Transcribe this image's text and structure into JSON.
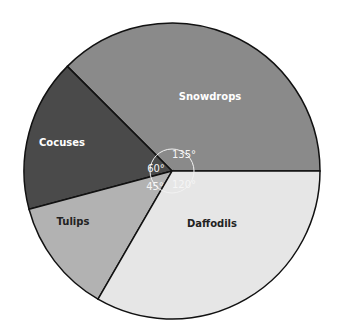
{
  "chart_data": {
    "type": "pie",
    "title": "",
    "unit": "degrees",
    "categories": [
      "Snowdrops",
      "Cocuses",
      "Tulips",
      "Daffodils"
    ],
    "values": [
      135,
      60,
      45,
      120
    ],
    "angle_labels": [
      "135°",
      "60°",
      "45°",
      "120°"
    ],
    "colors": [
      "#8a8a8a",
      "#4a4a4a",
      "#b2b2b2",
      "#e6e6e6"
    ],
    "label_colors": [
      "#ffffff",
      "#ffffff",
      "#222222",
      "#222222"
    ],
    "legend": "none"
  }
}
